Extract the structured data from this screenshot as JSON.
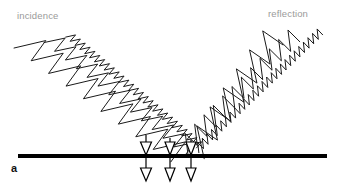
{
  "figure": {
    "panel_letter": "a",
    "width": 339,
    "height": 183,
    "background_color": "#ffffff",
    "label_color": "#9a9a9a",
    "stroke_color": "#1a1a1a",
    "surface_color": "#000000"
  },
  "labels": {
    "incidence": "incidence",
    "reflection": "reflection"
  },
  "surface": {
    "name": "reflecting-surface",
    "x_start": 18,
    "x_end": 327,
    "y": 156,
    "thickness": 4,
    "color": "#000000"
  },
  "chart_data": {
    "type": "line",
    "title": "",
    "subtitle": "",
    "xlabel": "",
    "ylabel": "",
    "xlim": [
      0,
      339
    ],
    "ylim": [
      183,
      0
    ],
    "grid": false,
    "legend_position": "none",
    "annotations": [
      {
        "text": "incidence",
        "x": 17,
        "y": 11,
        "color": "#9a9a9a"
      },
      {
        "text": "reflection",
        "x": 268,
        "y": 9,
        "color": "#9a9a9a"
      },
      {
        "text": "a",
        "x": 11,
        "y": 163,
        "color": "#111111"
      }
    ],
    "series": [
      {
        "name": "incident-wave-long-wavelength",
        "side": "incidence",
        "wavelength": 21.5,
        "amplitude": 12.5,
        "x_start": 21,
        "y_start": 38,
        "x_end": 178,
        "y_end": 152,
        "stroke": "#1a1a1a",
        "stroke_width": 1.0
      },
      {
        "name": "incident-wave-medium-wavelength",
        "side": "incidence",
        "wavelength": 13.5,
        "amplitude": 8.5,
        "x_start": 49,
        "y_start": 36,
        "x_end": 190,
        "y_end": 149,
        "stroke": "#1a1a1a",
        "stroke_width": 1.0
      },
      {
        "name": "incident-wave-short-wavelength",
        "side": "incidence",
        "wavelength": 6.4,
        "amplitude": 4.2,
        "x_start": 68,
        "y_start": 34,
        "x_end": 199,
        "y_end": 145,
        "stroke": "#1a1a1a",
        "stroke_width": 1.0
      },
      {
        "name": "reflected-wave-long-wavelength",
        "side": "reflection",
        "wavelength": 21.5,
        "amplitude": 12.5,
        "x_start": 194,
        "y_start": 152,
        "x_end": 273,
        "y_end": 38,
        "stroke": "#1a1a1a",
        "stroke_width": 1.0
      },
      {
        "name": "reflected-wave-medium-wavelength",
        "side": "reflection",
        "wavelength": 13.5,
        "amplitude": 8.5,
        "x_start": 182,
        "y_start": 149,
        "x_end": 294,
        "y_end": 36,
        "stroke": "#1a1a1a",
        "stroke_width": 1.0
      },
      {
        "name": "reflected-wave-short-wavelength",
        "side": "reflection",
        "wavelength": 6.4,
        "amplitude": 4.2,
        "x_start": 196,
        "y_start": 150,
        "x_end": 320,
        "y_end": 32,
        "stroke": "#1a1a1a",
        "stroke_width": 1.0
      }
    ],
    "arrows": [
      {
        "name": "penetration-arrow-1",
        "x": 146,
        "y_top": 135,
        "y_bottom": 181,
        "head_width": 11
      },
      {
        "name": "penetration-arrow-2",
        "x": 170,
        "y_top": 138,
        "y_bottom": 181,
        "head_width": 10
      },
      {
        "name": "penetration-arrow-3",
        "x": 191,
        "y_top": 140,
        "y_bottom": 181,
        "head_width": 10
      }
    ]
  }
}
